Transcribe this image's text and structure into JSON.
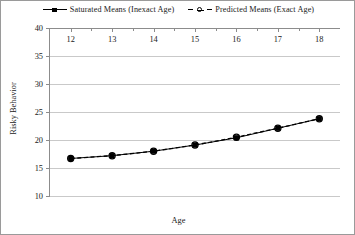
{
  "chart_data": {
    "type": "line",
    "title": "",
    "xlabel": "Age",
    "ylabel": "Risky Behavior",
    "x": [
      12,
      13,
      14,
      15,
      16,
      17,
      18
    ],
    "xticks": [
      "12",
      "13",
      "14",
      "15",
      "16",
      "17",
      "18"
    ],
    "yticks": [
      "10",
      "15",
      "20",
      "25",
      "30",
      "35",
      "40"
    ],
    "xlim": [
      11.5,
      18.5
    ],
    "ylim": [
      10,
      40
    ],
    "grid": "horizontal",
    "legend_position": "top-center",
    "series": [
      {
        "name": "Saturated Means (Inexact Age)",
        "marker": "filled-square",
        "linestyle": "solid",
        "color": "#000000",
        "values": [
          16.7,
          17.2,
          18.0,
          19.1,
          20.4,
          22.1,
          23.8
        ]
      },
      {
        "name": "Predicted Means (Exact Age)",
        "marker": "open-circle",
        "linestyle": "dashed",
        "color": "#000000",
        "values": [
          16.7,
          17.2,
          18.0,
          19.1,
          20.5,
          22.1,
          23.8
        ]
      }
    ]
  },
  "legend": {
    "entries": [
      {
        "label": "Saturated Means (Inexact Age)"
      },
      {
        "label": "Predicted Means (Exact Age)"
      }
    ]
  }
}
